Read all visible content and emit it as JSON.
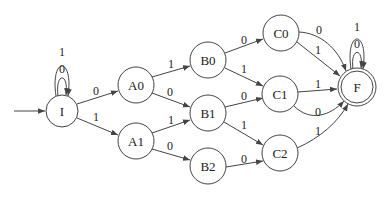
{
  "diagram": {
    "type": "finite-state-automaton",
    "start_state": "I",
    "accept_states": [
      "F"
    ],
    "nodes": [
      {
        "id": "I",
        "label": "I"
      },
      {
        "id": "A0",
        "label": "A0"
      },
      {
        "id": "A1",
        "label": "A1"
      },
      {
        "id": "B0",
        "label": "B0"
      },
      {
        "id": "B1",
        "label": "B1"
      },
      {
        "id": "B2",
        "label": "B2"
      },
      {
        "id": "C0",
        "label": "C0"
      },
      {
        "id": "C1",
        "label": "C1"
      },
      {
        "id": "C2",
        "label": "C2"
      },
      {
        "id": "F",
        "label": "F"
      }
    ],
    "edges": [
      {
        "from": "I",
        "to": "I",
        "label": "0"
      },
      {
        "from": "I",
        "to": "I",
        "label": "1"
      },
      {
        "from": "I",
        "to": "A0",
        "label": "0"
      },
      {
        "from": "I",
        "to": "A1",
        "label": "1"
      },
      {
        "from": "A0",
        "to": "B0",
        "label": "1"
      },
      {
        "from": "A0",
        "to": "B1",
        "label": "0"
      },
      {
        "from": "A1",
        "to": "B1",
        "label": "1"
      },
      {
        "from": "A1",
        "to": "B2",
        "label": "0"
      },
      {
        "from": "B0",
        "to": "C0",
        "label": "0"
      },
      {
        "from": "B0",
        "to": "C1",
        "label": "1"
      },
      {
        "from": "B1",
        "to": "C1",
        "label": "0"
      },
      {
        "from": "B1",
        "to": "C2",
        "label": "1"
      },
      {
        "from": "B2",
        "to": "C2",
        "label": "0"
      },
      {
        "from": "C0",
        "to": "F",
        "label": "0"
      },
      {
        "from": "C0",
        "to": "F",
        "label": "1"
      },
      {
        "from": "C1",
        "to": "F",
        "label": "1"
      },
      {
        "from": "C1",
        "to": "F",
        "label": "0"
      },
      {
        "from": "C2",
        "to": "F",
        "label": "1"
      },
      {
        "from": "F",
        "to": "F",
        "label": "0"
      },
      {
        "from": "F",
        "to": "F",
        "label": "1"
      }
    ]
  }
}
